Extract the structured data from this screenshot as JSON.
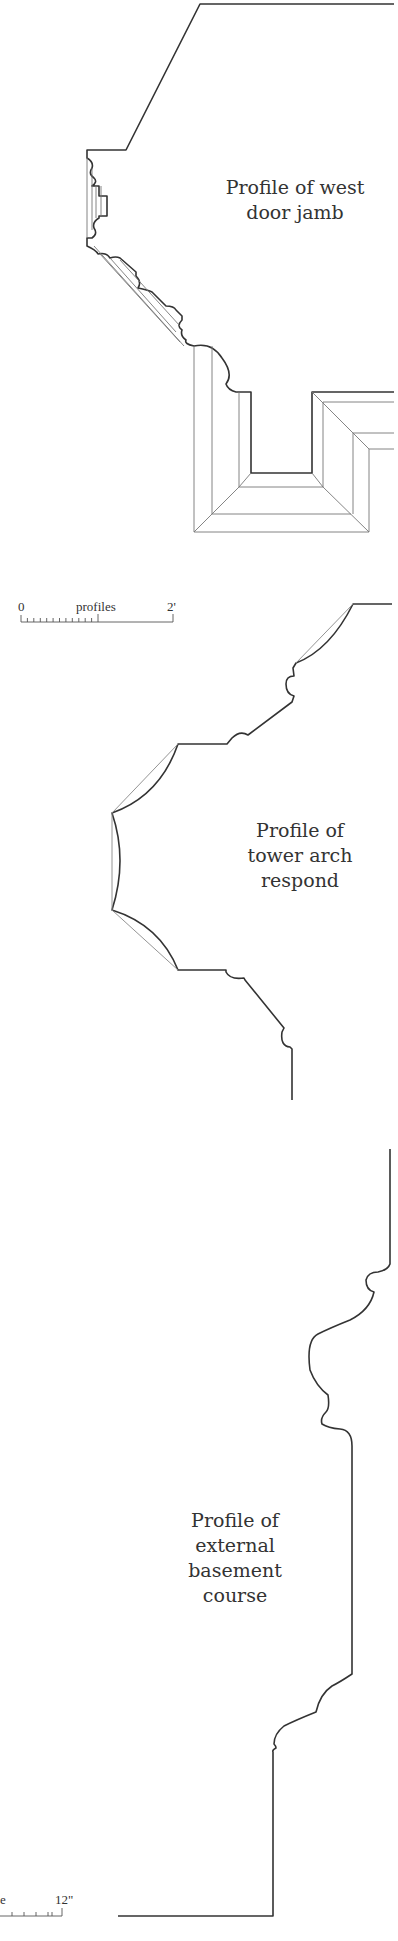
{
  "drawings": [
    {
      "id": "west-door-jamb",
      "caption_lines": [
        "Profile of west",
        "door jamb"
      ]
    },
    {
      "id": "tower-arch-respond",
      "caption_lines": [
        "Profile of",
        "tower arch",
        "respond"
      ]
    },
    {
      "id": "external-basement-course",
      "caption_lines": [
        "Profile of",
        "external",
        "basement",
        "course"
      ]
    }
  ],
  "scales": [
    {
      "id": "profiles-scale",
      "start_label": "0",
      "title": "profiles",
      "end_label": "2'",
      "minor_ticks": 12
    },
    {
      "id": "inch-scale",
      "title_fragment": "e",
      "end_label": "12\"",
      "minor_ticks": 5
    }
  ],
  "colors": {
    "line": "#333333",
    "thin_line": "#777777",
    "background": "#ffffff"
  }
}
